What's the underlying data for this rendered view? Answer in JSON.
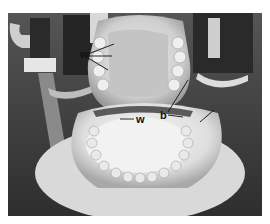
{
  "figure": {
    "labels": [
      {
        "text": "w",
        "id": "upper-left"
      },
      {
        "text": "w",
        "id": "lower-center"
      },
      {
        "text": "b",
        "id": "center-right"
      }
    ]
  }
}
